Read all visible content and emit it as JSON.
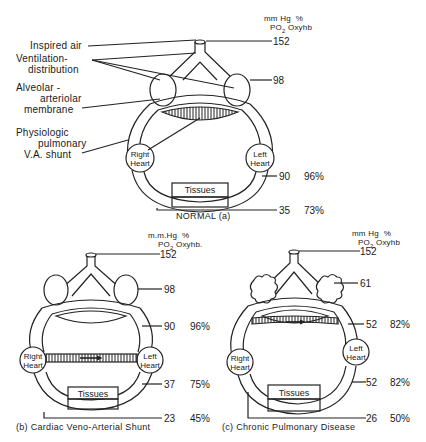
{
  "units": {
    "pressure": "mm Hg",
    "pressure_normal": "mm Hg",
    "pressure_b": "m.m.Hg",
    "percent": "%",
    "po2": "PO",
    "po2_sub": "2",
    "oxyhb": "Oxyhb",
    "oxyhb_b": "Oxyhb."
  },
  "normal": {
    "caption": "NORMAL (a)",
    "labels": {
      "inspired_air": "Inspired air",
      "ventilation_1": "Ventilation-",
      "ventilation_2": "distribution",
      "alveolar_1": "Alveolar -",
      "alveolar_2": "arteriolar",
      "alveolar_3": "membrane",
      "shunt_1": "Physiologic",
      "shunt_2": "pulmonary",
      "shunt_3": "V.A. shunt"
    },
    "right_heart_1": "Right",
    "right_heart_2": "Heart",
    "left_heart_1": "Left",
    "left_heart_2": "Heart",
    "tissues": "Tissues",
    "inspired_po2": "152",
    "alveolar_po2": "98",
    "arterial_po2": "90",
    "arterial_oxyhb": "96%",
    "venous_po2": "35",
    "venous_oxyhb": "73%"
  },
  "shunt": {
    "caption": "(b) Cardiac Veno-Arterial Shunt",
    "right_heart_1": "Right",
    "right_heart_2": "Heart",
    "left_heart_1": "Left",
    "left_heart_2": "Heart",
    "tissues": "Tissues",
    "inspired_po2": "152",
    "alveolar_po2": "98",
    "pulm_vein_po2": "90",
    "pulm_vein_oxyhb": "96%",
    "arterial_po2": "37",
    "arterial_oxyhb": "75%",
    "venous_po2": "23",
    "venous_oxyhb": "45%"
  },
  "copd": {
    "caption": "(c) Chronic Pulmonary Disease",
    "right_heart_1": "Right",
    "right_heart_2": "Heart",
    "left_heart_1": "Left",
    "left_heart_2": "Heart",
    "tissues": "Tissues",
    "inspired_po2": "152",
    "alveolar_po2": "61",
    "pulm_vein_po2": "52",
    "pulm_vein_oxyhb": "82%",
    "arterial_po2": "52",
    "arterial_oxyhb": "82%",
    "venous_po2": "26",
    "venous_oxyhb": "50%"
  }
}
